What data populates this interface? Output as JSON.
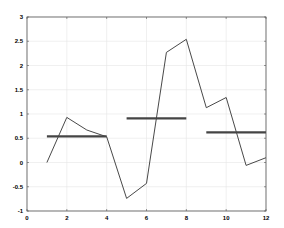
{
  "chart_data": {
    "type": "line",
    "title": "",
    "xlabel": "",
    "ylabel": "",
    "xlim": [
      0,
      12
    ],
    "ylim": [
      -1,
      3
    ],
    "grid": true,
    "legend": null,
    "xticks": [
      "0",
      "2",
      "4",
      "6",
      "8",
      "10",
      "12"
    ],
    "yticks": [
      "-1",
      "-0.5",
      "0",
      "0.5",
      "1",
      "1.5",
      "2",
      "2.5",
      "3"
    ],
    "series": [
      {
        "name": "signal",
        "style": "thin-line",
        "color": "#333333",
        "x": [
          1,
          2,
          3,
          4,
          5,
          6,
          7,
          8,
          9,
          10,
          11,
          12
        ],
        "y": [
          0.0,
          0.93,
          0.67,
          0.53,
          -0.74,
          -0.43,
          2.27,
          2.54,
          1.13,
          1.34,
          -0.06,
          0.1
        ]
      },
      {
        "name": "segment-mean-1",
        "style": "thick-line",
        "color": "#444444",
        "x": [
          1,
          4
        ],
        "y": [
          0.54,
          0.54
        ]
      },
      {
        "name": "segment-mean-2",
        "style": "thick-line",
        "color": "#444444",
        "x": [
          5,
          8
        ],
        "y": [
          0.91,
          0.91
        ]
      },
      {
        "name": "segment-mean-3",
        "style": "thick-line",
        "color": "#444444",
        "x": [
          9,
          12
        ],
        "y": [
          0.62,
          0.62
        ]
      }
    ]
  }
}
